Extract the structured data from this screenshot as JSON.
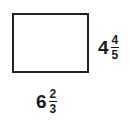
{
  "diagram": {
    "shape": "rectangle",
    "height_label": {
      "whole": "4",
      "numerator": "4",
      "denominator": "5"
    },
    "width_label": {
      "whole": "6",
      "numerator": "2",
      "denominator": "3"
    }
  }
}
